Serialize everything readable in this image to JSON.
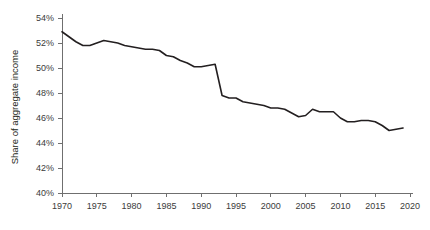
{
  "chart_data": {
    "type": "line",
    "title": "",
    "xlabel": "",
    "ylabel": "Share of aggregate income",
    "xlim": [
      1970,
      2020
    ],
    "ylim": [
      40,
      54
    ],
    "ytick_format": "percent",
    "grid": false,
    "legend": false,
    "x_ticks": [
      1970,
      1975,
      1980,
      1985,
      1990,
      1995,
      2000,
      2005,
      2010,
      2015,
      2020
    ],
    "x_tick_labels": [
      "1970",
      "1975",
      "1980",
      "1985",
      "1990",
      "1995",
      "2000",
      "2005",
      "2010",
      "2015",
      "2020"
    ],
    "y_ticks": [
      40,
      42,
      44,
      46,
      48,
      50,
      52,
      54
    ],
    "y_tick_labels": [
      "40%",
      "42%",
      "44%",
      "46%",
      "48%",
      "50%",
      "52%",
      "54%"
    ],
    "series": [
      {
        "name": "Share of aggregate income",
        "color": "#231f20",
        "x": [
          1970,
          1971,
          1972,
          1973,
          1974,
          1975,
          1976,
          1977,
          1978,
          1979,
          1980,
          1981,
          1982,
          1983,
          1984,
          1985,
          1986,
          1987,
          1988,
          1989,
          1990,
          1991,
          1992,
          1993,
          1994,
          1995,
          1996,
          1997,
          1998,
          1999,
          2000,
          2001,
          2002,
          2003,
          2004,
          2005,
          2006,
          2007,
          2008,
          2009,
          2010,
          2011,
          2012,
          2013,
          2014,
          2015,
          2016,
          2017,
          2018,
          2019
        ],
        "values": [
          52.9,
          52.5,
          52.1,
          51.8,
          51.8,
          52.0,
          52.2,
          52.1,
          52.0,
          51.8,
          51.7,
          51.6,
          51.5,
          51.5,
          51.4,
          51.0,
          50.9,
          50.6,
          50.4,
          50.1,
          50.1,
          50.2,
          50.3,
          47.8,
          47.6,
          47.6,
          47.3,
          47.2,
          47.1,
          47.0,
          46.8,
          46.8,
          46.7,
          46.4,
          46.1,
          46.2,
          46.7,
          46.5,
          46.5,
          46.5,
          46.0,
          45.7,
          45.7,
          45.8,
          45.8,
          45.7,
          45.4,
          45.0,
          45.1,
          45.2
        ]
      }
    ]
  },
  "axes": {
    "y_title": "Share of aggregate income"
  }
}
